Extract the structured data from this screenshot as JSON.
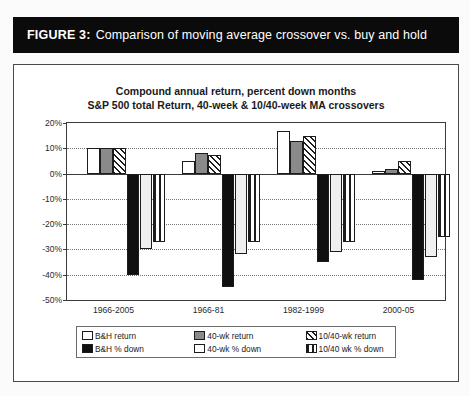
{
  "figure": {
    "label": "FIGURE 3:",
    "caption": "Comparison of moving average crossover vs. buy and hold"
  },
  "chart_data": {
    "type": "bar",
    "title": "Compound annual return, percent down months",
    "subtitle": "S&P 500 total Return, 40-week & 10/40-week MA crossovers",
    "xlabel": "",
    "ylabel": "",
    "ylim": [
      -50,
      20
    ],
    "ytick_labels": [
      "20%",
      "10%",
      "0%",
      "-10%",
      "-20%",
      "-30%",
      "-40%",
      "-50%"
    ],
    "ytick_values": [
      20,
      10,
      0,
      -10,
      -20,
      -30,
      -40,
      -50
    ],
    "grid": true,
    "legend_position": "bottom",
    "categories": [
      "1966-2005",
      "1966-81",
      "1982-1999",
      "2000-05"
    ],
    "series": [
      {
        "name": "B&H return",
        "pattern": "white",
        "values": [
          10.0,
          5.0,
          17.0,
          1.0
        ]
      },
      {
        "name": "40-wk return",
        "pattern": "gray",
        "values": [
          10.0,
          8.0,
          13.0,
          2.0
        ]
      },
      {
        "name": "10/40-wk return",
        "pattern": "diag",
        "values": [
          10.0,
          7.5,
          15.0,
          5.0
        ]
      },
      {
        "name": "B&H % down",
        "pattern": "black",
        "values": [
          -40.0,
          -45.0,
          -35.0,
          -42.0
        ]
      },
      {
        "name": "40-wk % down",
        "pattern": "dots",
        "values": [
          -30.0,
          -32.0,
          -31.0,
          -33.0
        ]
      },
      {
        "name": "10/40 wk % down",
        "pattern": "vert",
        "values": [
          -27.0,
          -27.0,
          -27.0,
          -25.0
        ]
      }
    ]
  },
  "legend": {
    "rows": [
      [
        {
          "label": "B&H return",
          "pattern": "white"
        },
        {
          "label": "40-wk return",
          "pattern": "gray"
        },
        {
          "label": "10/40-wk return",
          "pattern": "diag"
        }
      ],
      [
        {
          "label": "B&H % down",
          "pattern": "black"
        },
        {
          "label": "40-wk % down",
          "pattern": "white"
        },
        {
          "label": "10/40 wk % down",
          "pattern": "vert"
        }
      ]
    ]
  }
}
